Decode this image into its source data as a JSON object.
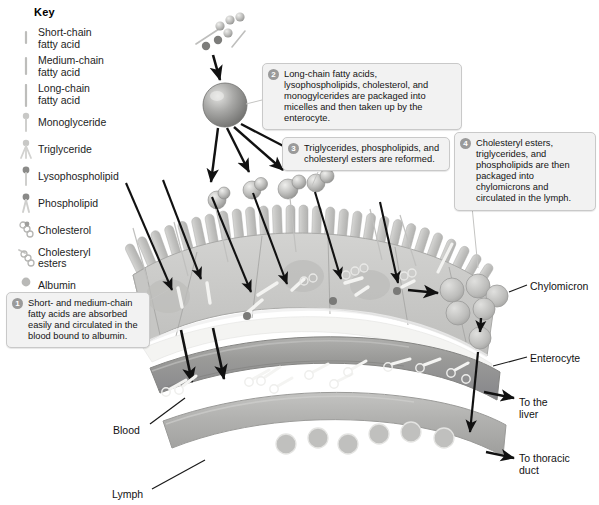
{
  "key": {
    "title": "Key",
    "items": [
      {
        "label": "Short-chain\nfatty acid",
        "icon": "short-chain-fatty-acid-icon"
      },
      {
        "label": "Medium-chain\nfatty acid",
        "icon": "medium-chain-fatty-acid-icon"
      },
      {
        "label": "Long-chain\nfatty acid",
        "icon": "long-chain-fatty-acid-icon"
      },
      {
        "label": "Monoglyceride",
        "icon": "monoglyceride-icon"
      },
      {
        "label": "Triglyceride",
        "icon": "triglyceride-icon"
      },
      {
        "label": "Lysophospholipid",
        "icon": "lysophospholipid-icon"
      },
      {
        "label": "Phospholipid",
        "icon": "phospholipid-icon"
      },
      {
        "label": "Cholesterol",
        "icon": "cholesterol-icon"
      },
      {
        "label": "Cholesteryl\nesters",
        "icon": "cholesteryl-esters-icon"
      },
      {
        "label": "Albumin",
        "icon": "albumin-icon"
      }
    ]
  },
  "callouts": [
    {
      "number": "1",
      "text": "Short- and medium-chain fatty acids are absorbed easily and circulated in the blood bound to albumin."
    },
    {
      "number": "2",
      "text": "Long-chain fatty acids, lysophospholipids, cholesterol, and monogylcerides are packaged into micelles and then taken up by the enterocyte."
    },
    {
      "number": "3",
      "text": "Triglycerides, phospholipids, and cholesteryl esters are reformed."
    },
    {
      "number": "4",
      "text": "Cholesteryl esters, triglycerides, and phospholipids are then packaged into chylomicrons and circulated in the lymph."
    }
  ],
  "labels": {
    "chylomicron": "Chylomicron",
    "enterocyte": "Enterocyte",
    "to_liver": "To the\nliver",
    "to_thoracic_duct": "To thoracic\nduct",
    "blood": "Blood",
    "lymph": "Lymph"
  },
  "colors": {
    "background": "#ffffff",
    "callout_fill": "#f2f2f2",
    "callout_border": "#c9c9c9",
    "badge": "#9a9a9a",
    "epithelium": "#c9c9c7",
    "microvilli": "#c2c2c0",
    "blood_vessel": "#9e9e9e",
    "lymph_vessel": "#b4b4b2",
    "micelle": "#8f8f8f",
    "chylomicron": "#b9b9b7",
    "arrow": "#111111",
    "text": "#1a1a1a"
  }
}
